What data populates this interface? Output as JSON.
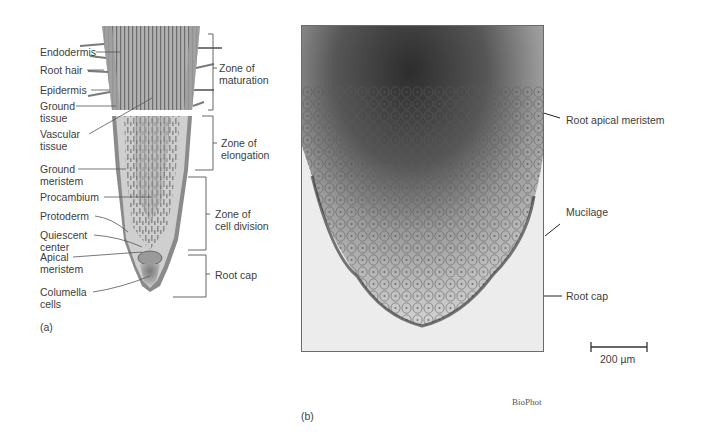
{
  "panel_a": {
    "caption": "(a)",
    "left_labels": [
      {
        "id": "endodermis",
        "text": "Endodermis"
      },
      {
        "id": "root-hair",
        "text": "Root hair"
      },
      {
        "id": "epidermis",
        "text": "Epidermis"
      },
      {
        "id": "ground-tissue",
        "text": "Ground tissue"
      },
      {
        "id": "vascular-tissue",
        "text": "Vascular tissue"
      },
      {
        "id": "ground-meristem",
        "text": "Ground meristem"
      },
      {
        "id": "procambium",
        "text": "Procambium"
      },
      {
        "id": "protoderm",
        "text": "Protoderm"
      },
      {
        "id": "quiescent-center",
        "text": "Quiescent center"
      },
      {
        "id": "apical-meristem",
        "text": "Apical meristem"
      },
      {
        "id": "columella-cells",
        "text": "Columella cells"
      }
    ],
    "zones": [
      {
        "id": "zone-maturation",
        "line1": "Zone of",
        "line2": "maturation"
      },
      {
        "id": "zone-elongation",
        "line1": "Zone of",
        "line2": "elongation"
      },
      {
        "id": "zone-cell-division",
        "line1": "Zone of",
        "line2": "cell division"
      },
      {
        "id": "root-cap-zone",
        "line1": "Root cap",
        "line2": ""
      }
    ]
  },
  "panel_b": {
    "caption": "(b)",
    "labels": [
      {
        "id": "root-apical-meristem",
        "text": "Root apical meristem"
      },
      {
        "id": "mucilage",
        "text": "Mucilage"
      },
      {
        "id": "root-cap",
        "text": "Root cap"
      }
    ],
    "scale_bar": "200 µm",
    "credit": "BioPhot"
  },
  "colors": {
    "root_outer": "#8c8c8c",
    "root_inner": "#c9c9c9",
    "micrograph_dark": "#3e3e3e",
    "leader_line": "#4a4a4a"
  }
}
